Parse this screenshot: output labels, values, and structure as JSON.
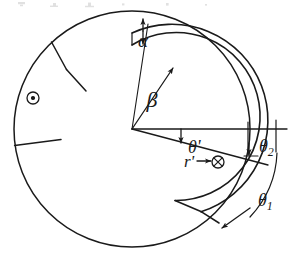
{
  "figure": {
    "background_color": "#ffffff",
    "stroke_color": "#1a1a1a",
    "labels": {
      "alpha": "α",
      "beta": "β",
      "theta_prime": "θ'",
      "theta_1": "θ",
      "theta_1_sub": "1",
      "theta_2": "θ",
      "theta_2_sub": "2",
      "r_prime": "r'",
      "out_of_page": "⊙",
      "into_page": "⊗"
    },
    "geometry": {
      "center_x": 132,
      "center_y": 129,
      "outer_radius": 118,
      "middle_radius": 96,
      "inner_radius": 84,
      "horizontal_axis_end_x": 287
    }
  }
}
